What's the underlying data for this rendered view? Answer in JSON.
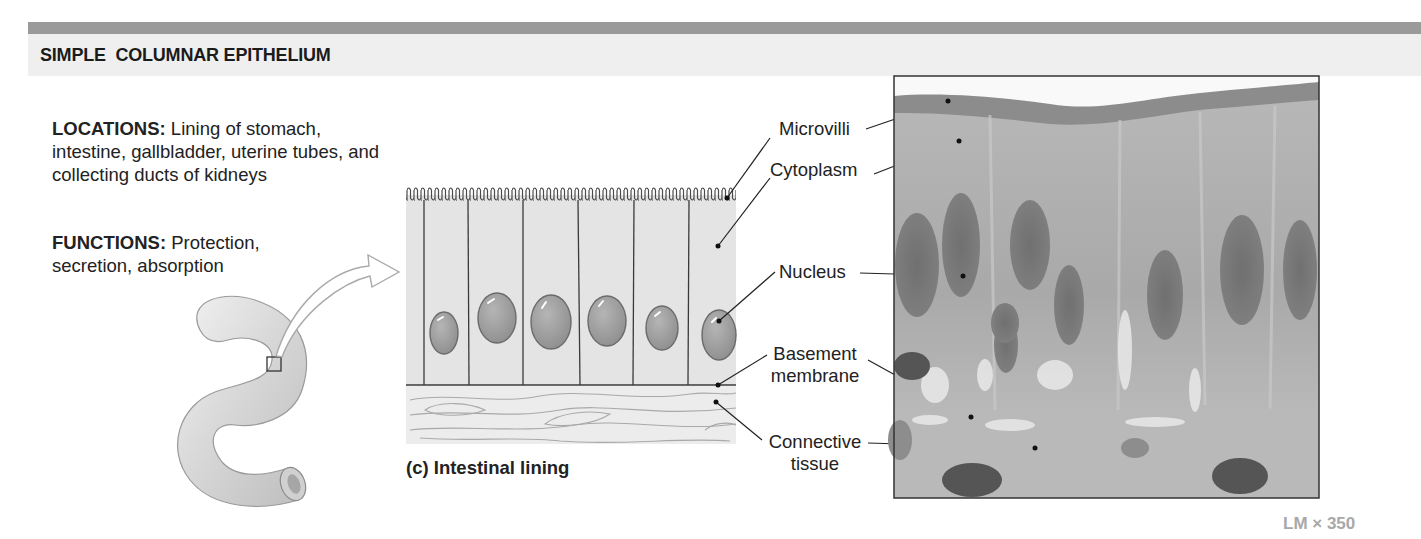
{
  "header": {
    "title": "SIMPLE  COLUMNAR EPITHELIUM",
    "bar_color": "#9a9a9a",
    "band_color": "#efefef"
  },
  "description": {
    "locations_label": "LOCATIONS:",
    "locations_text": " Lining of stomach, intestine, gallbladder, uterine tubes, and collecting ducts of kidneys",
    "functions_label": "FUNCTIONS:",
    "functions_text": " Protection, secretion, absorption"
  },
  "illustration": {
    "organ_icon": "intestine-tube",
    "zoom_arrow": "curved-arrow",
    "caption": "(c) Intestinal lining",
    "cell_count": 6
  },
  "labels": [
    {
      "id": "microvilli",
      "text": "Microvilli"
    },
    {
      "id": "cytoplasm",
      "text": "Cytoplasm"
    },
    {
      "id": "nucleus",
      "text": "Nucleus"
    },
    {
      "id": "basement",
      "line1": "Basement",
      "line2": "membrane"
    },
    {
      "id": "connective",
      "line1": "Connective",
      "line2": "tissue"
    }
  ],
  "micrograph": {
    "magnification": "LM × 350"
  }
}
